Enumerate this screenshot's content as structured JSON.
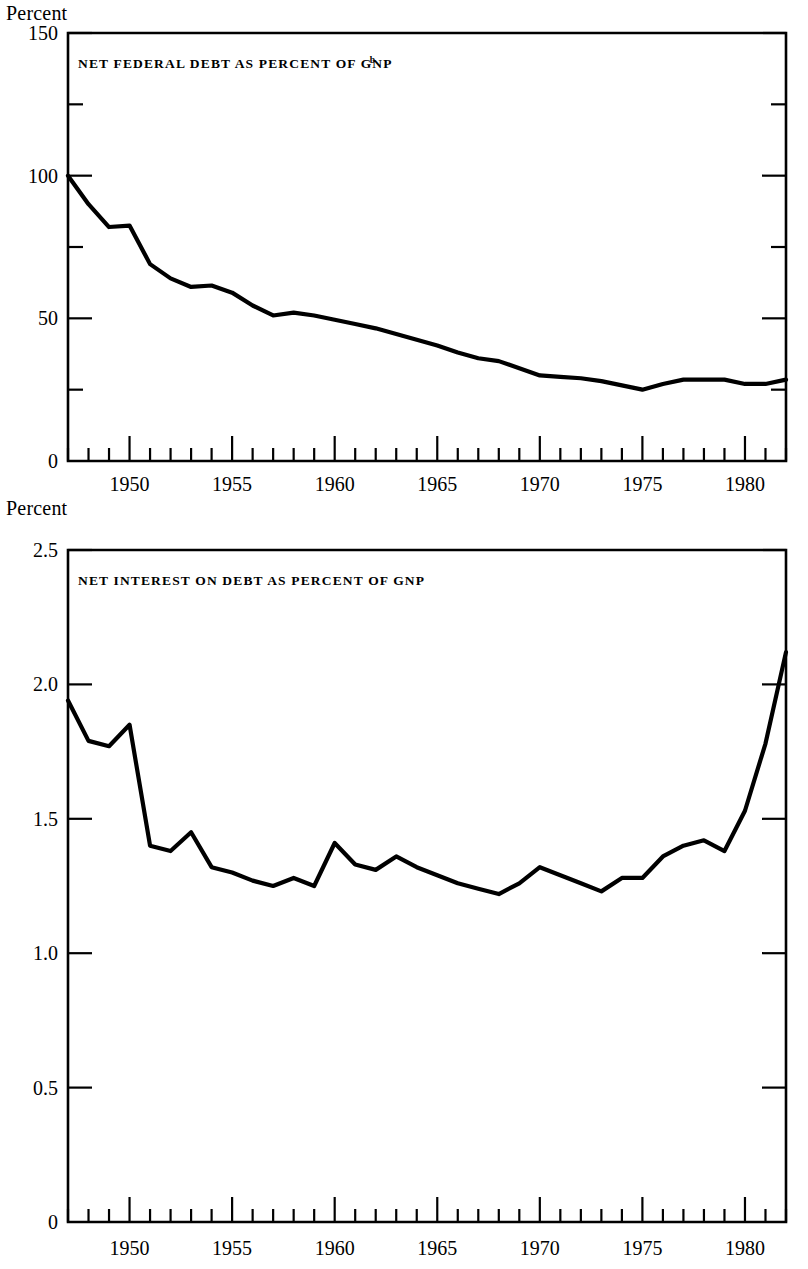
{
  "page": {
    "background": "#ffffff",
    "ink_color": "#000000"
  },
  "chart_data": [
    {
      "id": "net-federal-debt",
      "type": "line",
      "title": "NET FEDERAL DEBT AS PERCENT OF GNP",
      "title_superscript": "b",
      "ylabel": "Percent",
      "xlabel": "",
      "ylim": [
        0,
        150
      ],
      "xlim": [
        1947,
        1982
      ],
      "ytick_labels": [
        "0",
        "50",
        "100",
        "150"
      ],
      "ytick_values": [
        0,
        50,
        100,
        150
      ],
      "yminor_values": [
        25,
        75,
        125
      ],
      "xtick_labels": [
        "1950",
        "1955",
        "1960",
        "1965",
        "1970",
        "1975",
        "1980"
      ],
      "xtick_values": [
        1950,
        1955,
        1960,
        1965,
        1970,
        1975,
        1980
      ],
      "grid": false,
      "legend": "none",
      "x": [
        1947,
        1948,
        1949,
        1950,
        1951,
        1952,
        1953,
        1954,
        1955,
        1956,
        1957,
        1958,
        1959,
        1960,
        1961,
        1962,
        1963,
        1964,
        1965,
        1966,
        1967,
        1968,
        1969,
        1970,
        1971,
        1972,
        1973,
        1974,
        1975,
        1976,
        1977,
        1978,
        1979,
        1980,
        1981,
        1982
      ],
      "values": [
        100.0,
        90.0,
        82.0,
        82.5,
        69.0,
        64.0,
        61.0,
        61.5,
        59.0,
        54.5,
        51.0,
        52.0,
        51.0,
        49.5,
        48.0,
        46.5,
        44.5,
        42.5,
        40.5,
        38.0,
        36.0,
        35.0,
        32.5,
        30.0,
        29.5,
        29.0,
        28.0,
        26.5,
        25.0,
        27.0,
        28.5,
        28.5,
        28.5,
        27.0,
        27.0,
        28.5
      ]
    },
    {
      "id": "net-interest-on-debt",
      "type": "line",
      "title": "NET INTEREST ON DEBT AS PERCENT OF GNP",
      "title_superscript": "",
      "ylabel": "Percent",
      "xlabel": "",
      "ylim": [
        0,
        2.5
      ],
      "xlim": [
        1947,
        1982
      ],
      "ytick_labels": [
        "0",
        "0.5",
        "1.0",
        "1.5",
        "2.0",
        "2.5"
      ],
      "ytick_values": [
        0,
        0.5,
        1.0,
        1.5,
        2.0,
        2.5
      ],
      "yminor_values": [],
      "xtick_labels": [
        "1950",
        "1955",
        "1960",
        "1965",
        "1970",
        "1975",
        "1980"
      ],
      "xtick_values": [
        1950,
        1955,
        1960,
        1965,
        1970,
        1975,
        1980
      ],
      "grid": false,
      "legend": "none",
      "x": [
        1947,
        1948,
        1949,
        1950,
        1951,
        1952,
        1953,
        1954,
        1955,
        1956,
        1957,
        1958,
        1959,
        1960,
        1961,
        1962,
        1963,
        1964,
        1965,
        1966,
        1967,
        1968,
        1969,
        1970,
        1971,
        1972,
        1973,
        1974,
        1975,
        1976,
        1977,
        1978,
        1979,
        1980,
        1981,
        1982
      ],
      "values": [
        1.94,
        1.79,
        1.77,
        1.85,
        1.4,
        1.38,
        1.45,
        1.32,
        1.3,
        1.27,
        1.25,
        1.28,
        1.25,
        1.41,
        1.33,
        1.31,
        1.36,
        1.32,
        1.29,
        1.26,
        1.24,
        1.22,
        1.26,
        1.32,
        1.29,
        1.26,
        1.23,
        1.28,
        1.28,
        1.36,
        1.4,
        1.42,
        1.38,
        1.53,
        1.78,
        2.12
      ]
    }
  ],
  "panels": [
    {
      "name": "debt-panel",
      "unit_label": "Percent"
    },
    {
      "name": "interest-panel",
      "unit_label": "Percent"
    }
  ]
}
